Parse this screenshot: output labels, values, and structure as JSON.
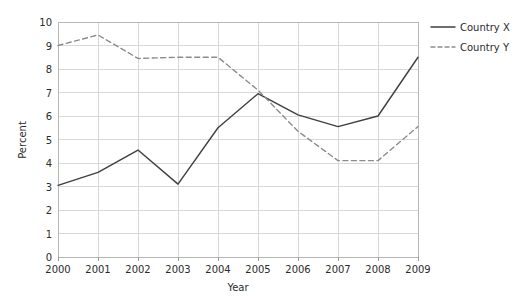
{
  "chart_data": {
    "type": "line",
    "title": "",
    "xlabel": "Year",
    "ylabel": "Percent",
    "categories": [
      "2000",
      "2001",
      "2002",
      "2003",
      "2004",
      "2005",
      "2006",
      "2007",
      "2008",
      "2009"
    ],
    "x": [
      2000,
      2001,
      2002,
      2003,
      2004,
      2005,
      2006,
      2007,
      2008,
      2009
    ],
    "series": [
      {
        "name": "Country X",
        "style": "solid",
        "color": "#3f3f3f",
        "values": [
          3.05,
          3.6,
          4.55,
          3.1,
          5.5,
          6.95,
          6.05,
          5.55,
          6.0,
          8.5
        ]
      },
      {
        "name": "Country Y",
        "style": "dashed",
        "color": "#8c8c8c",
        "values": [
          9.0,
          9.45,
          8.45,
          8.5,
          8.5,
          7.1,
          5.35,
          4.1,
          4.1,
          5.55
        ]
      }
    ],
    "ylim": [
      0,
      10
    ],
    "yticks": [
      "0",
      "1",
      "2",
      "3",
      "4",
      "5",
      "6",
      "7",
      "8",
      "9",
      "10"
    ],
    "xlim": [
      2000,
      2009
    ],
    "grid": true,
    "legend_position": "right"
  },
  "legend": {
    "entries": [
      {
        "label": "Country X"
      },
      {
        "label": "Country Y"
      }
    ]
  },
  "colors": {
    "series_x": "#3f3f3f",
    "series_y": "#8c8c8c",
    "grid": "#d8d8d8",
    "border": "#b7b7b7",
    "background": "#ffffff",
    "text": "#2b2b2b"
  }
}
